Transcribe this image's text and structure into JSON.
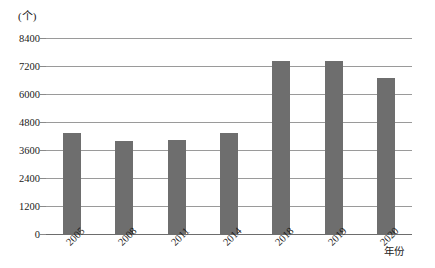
{
  "chart_data": {
    "type": "bar",
    "title": "",
    "subtitle": "",
    "unit_label": "(个)",
    "xlabel": "年份",
    "ylabel": "",
    "categories": [
      "2005",
      "2008",
      "2011",
      "2014",
      "2018",
      "2019",
      "2020"
    ],
    "values": [
      4330,
      3990,
      4030,
      4350,
      7410,
      7420,
      6690
    ],
    "ylim": [
      0,
      8400
    ],
    "yticks": [
      0,
      1200,
      2400,
      3600,
      4800,
      6000,
      7200,
      8400
    ],
    "ytick_labels": [
      "0",
      "1200",
      "2400",
      "3600",
      "4800",
      "6000",
      "7200",
      "8400"
    ],
    "grid": true,
    "legend": null,
    "legend_position": "none",
    "series": [
      {
        "name": "数量",
        "values": [
          4330,
          3990,
          4030,
          4350,
          7410,
          7420,
          6690
        ]
      }
    ]
  },
  "style": {
    "bar_color": "#6e6e6e",
    "grid_color": "#9a9a9a",
    "axis_color": "#6d6d6d",
    "text_color": "#1a1a1a",
    "background": "#ffffff"
  }
}
